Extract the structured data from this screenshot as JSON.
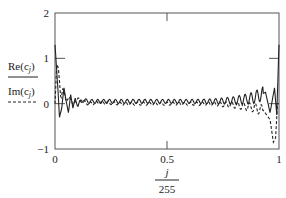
{
  "chart_data": {
    "type": "line",
    "title": "",
    "xlabel_numerator": "j",
    "xlabel_denominator": "255",
    "xlabel": "j/255",
    "ylabel": "Re(c_j), Im(c_j)",
    "xlim": [
      0,
      1
    ],
    "ylim": [
      -1,
      2
    ],
    "x_ticks": [
      "0",
      "0.5",
      "1"
    ],
    "y_ticks": [
      "-1",
      "0",
      "1",
      "2"
    ],
    "grid": false,
    "legend_position": "left",
    "series": [
      {
        "name": "Re(c_j)",
        "style": "solid",
        "x": [
          0,
          0.004,
          0.012,
          0.02,
          0.03,
          0.04,
          0.05,
          0.06,
          0.07,
          0.08,
          0.09,
          0.1,
          0.12,
          0.15,
          0.2,
          0.3,
          0.4,
          0.5,
          0.6,
          0.7,
          0.8,
          0.85,
          0.88,
          0.91,
          0.94,
          0.96,
          0.98,
          0.99,
          1.0
        ],
        "values": [
          1.3,
          1.0,
          0.4,
          -0.3,
          -0.1,
          0.35,
          0.05,
          -0.2,
          0.2,
          -0.1,
          0.12,
          -0.05,
          0.08,
          0.05,
          0.05,
          0.05,
          0.05,
          0.05,
          0.05,
          0.05,
          0.07,
          0.1,
          0.12,
          0.18,
          0.25,
          -0.2,
          0.35,
          -0.25,
          1.3
        ]
      },
      {
        "name": "Im(c_j)",
        "style": "dashed",
        "x": [
          0,
          0.008,
          0.016,
          0.026,
          0.036,
          0.05,
          0.065,
          0.08,
          0.1,
          0.15,
          0.2,
          0.3,
          0.4,
          0.5,
          0.6,
          0.7,
          0.8,
          0.88,
          0.93,
          0.96,
          0.975,
          0.985,
          0.993,
          1.0
        ],
        "values": [
          0.0,
          0.9,
          0.75,
          0.1,
          0.35,
          0.05,
          0.15,
          -0.02,
          0.1,
          0.0,
          0.03,
          0.0,
          0.0,
          0.0,
          0.0,
          0.0,
          -0.03,
          -0.08,
          -0.15,
          -0.35,
          -0.85,
          -0.75,
          0.0,
          0.0
        ]
      }
    ],
    "annotations": []
  },
  "axes": {
    "x_ticks": [
      {
        "value": 0,
        "label": "0"
      },
      {
        "value": 0.5,
        "label": "0.5"
      },
      {
        "value": 1,
        "label": "1"
      }
    ],
    "y_ticks": [
      {
        "value": -1,
        "label": "−1"
      },
      {
        "value": 0,
        "label": "0"
      },
      {
        "value": 1,
        "label": "1"
      },
      {
        "value": 2,
        "label": "2"
      }
    ],
    "x_title": {
      "numerator": "j",
      "denominator": "255"
    }
  },
  "legend": {
    "items": [
      {
        "label_main": "Re(c",
        "label_sub": "j",
        "label_close": ")",
        "style": "solid"
      },
      {
        "label_main": "Im(c",
        "label_sub": "j",
        "label_close": ")",
        "style": "dashed"
      }
    ]
  },
  "colors": {
    "axis": "#555555",
    "line": "#222222",
    "background": "#ffffff"
  }
}
